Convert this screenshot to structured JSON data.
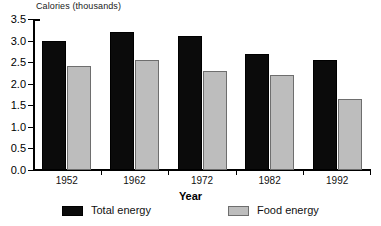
{
  "chart_data": {
    "type": "bar",
    "title": "",
    "ylabel": "Calories (thousands)",
    "xlabel": "Year",
    "categories": [
      "1952",
      "1962",
      "1972",
      "1982",
      "1992"
    ],
    "series": [
      {
        "name": "Total energy",
        "color": "#0b0b0b",
        "values": [
          3.0,
          3.2,
          3.1,
          2.68,
          2.55
        ]
      },
      {
        "name": "Food energy",
        "color": "#bdbdbd",
        "values": [
          2.4,
          2.55,
          2.3,
          2.2,
          1.65
        ]
      }
    ],
    "ylim": [
      0.0,
      3.5
    ],
    "ytick_labels": [
      "0.0",
      "0.5",
      "1.0",
      "1.5",
      "2.0",
      "2.5",
      "3.0",
      "3.5"
    ],
    "ytick_values": [
      0.0,
      0.5,
      1.0,
      1.5,
      2.0,
      2.5,
      3.0,
      3.5
    ],
    "grid": false,
    "legend_position": "bottom"
  },
  "legend": {
    "items": [
      {
        "label": "Total energy"
      },
      {
        "label": "Food energy"
      }
    ]
  }
}
